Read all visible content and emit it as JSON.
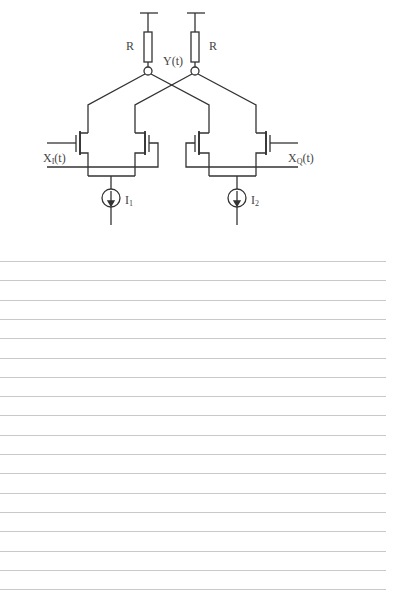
{
  "diagram": {
    "title": "",
    "labels": {
      "resistor_left": "R",
      "resistor_right": "R",
      "output_node": "Y(t)",
      "input_i_main": "X",
      "input_i_sub": "I",
      "input_i_suffix": "(t)",
      "input_q_main": "X",
      "input_q_sub": "Q",
      "input_q_suffix": "(t)",
      "current_source_1_main": "I",
      "current_source_1_sub": "1",
      "current_source_2_main": "I",
      "current_source_2_sub": "2"
    },
    "components": {
      "supplies": 2,
      "resistors": 2,
      "transistors": 4,
      "current_sources": 2,
      "output_nodes": 2
    },
    "colors": {
      "stroke": "#333333",
      "text": "#444444",
      "ruled_line": "#c9c9c9",
      "background": "#ffffff"
    }
  },
  "lined_paper": {
    "line_count": 18,
    "first_line_y": 261,
    "spacing": 19.3
  }
}
